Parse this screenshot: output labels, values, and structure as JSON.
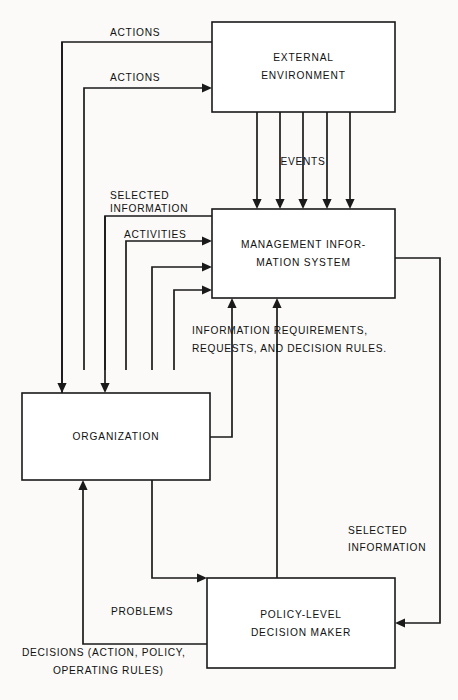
{
  "diagram": {
    "background_color": "#fbfaf8",
    "stroke_color": "#1a1a1a",
    "fill_color": "#ffffff",
    "boxes": [
      {
        "id": "external-environment",
        "line1": "EXTERNAL",
        "line2": "ENVIRONMENT",
        "x": 212,
        "y": 22,
        "w": 183,
        "h": 90
      },
      {
        "id": "management-information-system",
        "line1": "MANAGEMENT  INFOR-",
        "line2": "MATION  SYSTEM",
        "x": 212,
        "y": 209,
        "w": 183,
        "h": 89
      },
      {
        "id": "organization",
        "line1": "ORGANIZATION",
        "line2": "",
        "x": 22,
        "y": 393,
        "w": 188,
        "h": 87
      },
      {
        "id": "policy-level-decision-maker",
        "line1": "POLICY-LEVEL",
        "line2": "DECISION  MAKER",
        "x": 207,
        "y": 578,
        "w": 188,
        "h": 90
      }
    ],
    "edge_labels": [
      {
        "id": "actions-top",
        "text": "ACTIONS",
        "x": 110,
        "y": 33,
        "anchor": "start"
      },
      {
        "id": "actions-second",
        "text": "ACTIONS",
        "x": 110,
        "y": 78,
        "anchor": "start"
      },
      {
        "id": "events",
        "text": "EVENTS",
        "x": 303,
        "y": 162,
        "anchor": "middle"
      },
      {
        "id": "selected-info-1",
        "text": "SELECTED",
        "x": 110,
        "y": 196,
        "anchor": "start"
      },
      {
        "id": "selected-info-2",
        "text": "INFORMATION",
        "x": 110,
        "y": 209,
        "anchor": "start"
      },
      {
        "id": "activities",
        "text": "ACTIVITIES",
        "x": 124,
        "y": 235,
        "anchor": "start"
      },
      {
        "id": "info-req-1",
        "text": "INFORMATION  REQUIREMENTS,",
        "x": 192,
        "y": 331,
        "anchor": "start"
      },
      {
        "id": "info-req-2",
        "text": "REQUESTS,  AND  DECISION  RULES.",
        "x": 192,
        "y": 349,
        "anchor": "start"
      },
      {
        "id": "selected-info-3",
        "text": "SELECTED",
        "x": 348,
        "y": 531,
        "anchor": "start"
      },
      {
        "id": "selected-info-4",
        "text": "INFORMATION",
        "x": 348,
        "y": 548,
        "anchor": "start"
      },
      {
        "id": "problems",
        "text": "PROBLEMS",
        "x": 111,
        "y": 612,
        "anchor": "start"
      },
      {
        "id": "decisions-1",
        "text": "DECISIONS  (ACTION,  POLICY,",
        "x": 22,
        "y": 653,
        "anchor": "start"
      },
      {
        "id": "decisions-2",
        "text": "OPERATING  RULES)",
        "x": 53,
        "y": 671,
        "anchor": "start"
      }
    ],
    "flows": [
      {
        "id": "actions-top-flow",
        "path": "M 62 480 L 62 42 L 395 42"
      },
      {
        "id": "actions-second-flow",
        "path": "M 84 370 L 84 88 L 208 88"
      },
      {
        "id": "selected-info-flow",
        "path": "M 105 370 L 105 216 L 395 216"
      },
      {
        "id": "activities-flow",
        "path": "M 126 370 L 126 241 L 208 241"
      },
      {
        "id": "org-to-mis-1",
        "path": "M 152 370 L 152 267 L 208 267"
      },
      {
        "id": "org-to-mis-2",
        "path": "M 174 370 L 174 290 L 208 290"
      },
      {
        "id": "org-right-to-mis-bottom",
        "path": "M 210 437 L 232 437 L 232 306"
      },
      {
        "id": "policy-to-mis-bottom",
        "path": "M 277 578 L 277 306"
      },
      {
        "id": "mis-to-policy-right",
        "path": "M 395 258 L 440 258 L 440 623 L 399 623"
      },
      {
        "id": "problems-flow",
        "path": "M 152 480 L 152 578 L 203 578"
      },
      {
        "id": "decisions-flow",
        "path": "M 207 644 L 83 644 L 83 484"
      },
      {
        "id": "event-arrow-1",
        "path": "M 257 112 L 257 205"
      },
      {
        "id": "event-arrow-2",
        "path": "M 280 112 L 280 205"
      },
      {
        "id": "event-arrow-3",
        "path": "M 303 112 L 303 205"
      },
      {
        "id": "event-arrow-4",
        "path": "M 327 112 L 327 205"
      },
      {
        "id": "event-arrow-5",
        "path": "M 350 112 L 350 205"
      },
      {
        "id": "env-to-org-1",
        "path": "M 62 42 L 62 389"
      },
      {
        "id": "env-to-org-2",
        "path": "M 105 216 L 105 389"
      }
    ],
    "arrowheads": [
      {
        "id": "arrow-actions-second-into-env",
        "x": 212,
        "y": 88,
        "dir": "right"
      },
      {
        "id": "arrow-activities-into-mis",
        "x": 212,
        "y": 241,
        "dir": "right"
      },
      {
        "id": "arrow-org-to-mis-1",
        "x": 212,
        "y": 267,
        "dir": "right"
      },
      {
        "id": "arrow-org-to-mis-2",
        "x": 212,
        "y": 290,
        "dir": "right"
      },
      {
        "id": "arrow-events-1",
        "x": 257,
        "y": 209,
        "dir": "down"
      },
      {
        "id": "arrow-events-2",
        "x": 280,
        "y": 209,
        "dir": "down"
      },
      {
        "id": "arrow-events-3",
        "x": 303,
        "y": 209,
        "dir": "down"
      },
      {
        "id": "arrow-events-4",
        "x": 327,
        "y": 209,
        "dir": "down"
      },
      {
        "id": "arrow-events-5",
        "x": 350,
        "y": 209,
        "dir": "down"
      },
      {
        "id": "arrow-org-right-into-mis",
        "x": 232,
        "y": 298,
        "dir": "up"
      },
      {
        "id": "arrow-policy-into-mis",
        "x": 277,
        "y": 298,
        "dir": "up"
      },
      {
        "id": "arrow-env-to-org-1",
        "x": 62,
        "y": 393,
        "dir": "down"
      },
      {
        "id": "arrow-env-to-org-2",
        "x": 105,
        "y": 393,
        "dir": "down"
      },
      {
        "id": "arrow-mis-into-policy",
        "x": 395,
        "y": 623,
        "dir": "left"
      },
      {
        "id": "arrow-problems-into-policy",
        "x": 207,
        "y": 578,
        "dir": "right"
      },
      {
        "id": "arrow-decisions-into-org",
        "x": 83,
        "y": 480,
        "dir": "up"
      }
    ]
  }
}
